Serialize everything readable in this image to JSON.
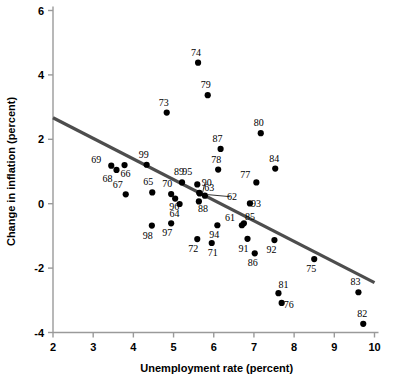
{
  "chart_data": {
    "type": "scatter",
    "title": "",
    "xlabel": "Unemployment rate (percent)",
    "ylabel": "Change in inflation (percent)",
    "xlim": [
      2,
      10
    ],
    "ylim": [
      -4,
      6
    ],
    "xticks": [
      2,
      3,
      4,
      5,
      6,
      7,
      8,
      9,
      10
    ],
    "yticks": [
      -4,
      -2,
      0,
      2,
      4,
      6
    ],
    "xtick_labels": [
      "2",
      "3",
      "4",
      "5",
      "6",
      "7",
      "8",
      "9",
      "10"
    ],
    "ytick_labels": [
      "-4",
      "-2",
      "0",
      "2",
      "4",
      "6"
    ],
    "grid": false,
    "legend": "none",
    "point_color": "#000000",
    "trendline_color": "#4d4d4d",
    "axis_color": "#9a9a9a",
    "trendline": {
      "x0": 2.0,
      "y0": 2.67,
      "x1": 10.0,
      "y1": -2.45
    },
    "point_label_position": "above-left-of-marker",
    "points": [
      {
        "label": "61",
        "x": 6.7,
        "y": -0.67,
        "lx": -12,
        "ly": -4
      },
      {
        "label": "62",
        "x": 5.78,
        "y": 0.25,
        "lx": 27,
        "ly": 4,
        "leader": true
      },
      {
        "label": "63",
        "x": 5.64,
        "y": 0.34,
        "lx": 10,
        "ly": -2
      },
      {
        "label": "64",
        "x": 5.15,
        "y": -0.01,
        "lx": -5,
        "ly": 13
      },
      {
        "label": "65",
        "x": 4.47,
        "y": 0.35,
        "lx": -4,
        "ly": -7
      },
      {
        "label": "66",
        "x": 3.78,
        "y": 1.2,
        "lx": 1,
        "ly": 12
      },
      {
        "label": "67",
        "x": 3.81,
        "y": 0.29,
        "lx": -8,
        "ly": -6
      },
      {
        "label": "68",
        "x": 3.58,
        "y": 1.05,
        "lx": -9,
        "ly": 12
      },
      {
        "label": "69",
        "x": 3.45,
        "y": 1.18,
        "lx": -15,
        "ly": -3
      },
      {
        "label": "70",
        "x": 4.94,
        "y": 0.3,
        "lx": -4,
        "ly": -7
      },
      {
        "label": "71",
        "x": 5.95,
        "y": -1.22,
        "lx": 1,
        "ly": 13
      },
      {
        "label": "72",
        "x": 5.59,
        "y": -1.1,
        "lx": -4,
        "ly": 13
      },
      {
        "label": "73",
        "x": 4.83,
        "y": 2.83,
        "lx": -3,
        "ly": -7
      },
      {
        "label": "74",
        "x": 5.61,
        "y": 4.38,
        "lx": -2,
        "ly": -7
      },
      {
        "label": "75",
        "x": 8.5,
        "y": -1.72,
        "lx": -3,
        "ly": 13
      },
      {
        "label": "76",
        "x": 7.69,
        "y": -3.08,
        "lx": 7,
        "ly": 5
      },
      {
        "label": "77",
        "x": 7.06,
        "y": 0.66,
        "lx": -11,
        "ly": -4
      },
      {
        "label": "78",
        "x": 6.11,
        "y": 1.06,
        "lx": -2,
        "ly": -7
      },
      {
        "label": "79",
        "x": 5.85,
        "y": 3.37,
        "lx": -2,
        "ly": -7
      },
      {
        "label": "80",
        "x": 7.17,
        "y": 2.19,
        "lx": -2,
        "ly": -7
      },
      {
        "label": "81",
        "x": 7.61,
        "y": -2.78,
        "lx": 5,
        "ly": -5
      },
      {
        "label": "82",
        "x": 9.72,
        "y": -3.73,
        "lx": -1,
        "ly": -7
      },
      {
        "label": "83",
        "x": 9.6,
        "y": -2.75,
        "lx": -3,
        "ly": -7
      },
      {
        "label": "84",
        "x": 7.53,
        "y": 1.09,
        "lx": -1,
        "ly": -7
      },
      {
        "label": "85",
        "x": 6.75,
        "y": -0.61,
        "lx": 6,
        "ly": -3
      },
      {
        "label": "86",
        "x": 7.02,
        "y": -1.54,
        "lx": -2,
        "ly": 13
      },
      {
        "label": "87",
        "x": 6.17,
        "y": 1.7,
        "lx": -3,
        "ly": -7
      },
      {
        "label": "88",
        "x": 5.63,
        "y": 0.07,
        "lx": 4,
        "ly": 11
      },
      {
        "label": "89",
        "x": 5.21,
        "y": 0.66,
        "lx": -3,
        "ly": -7
      },
      {
        "label": "90",
        "x": 5.65,
        "y": 0.32,
        "lx": 7,
        "ly": -7,
        "leader": true
      },
      {
        "label": "91",
        "x": 6.84,
        "y": -1.09,
        "lx": -4,
        "ly": 13
      },
      {
        "label": "92",
        "x": 7.51,
        "y": -1.13,
        "lx": -3,
        "ly": 13
      },
      {
        "label": "93",
        "x": 6.9,
        "y": 0.01,
        "lx": 6,
        "ly": 4
      },
      {
        "label": "94",
        "x": 6.09,
        "y": -0.67,
        "lx": -3,
        "ly": 13
      },
      {
        "label": "95",
        "x": 5.59,
        "y": 0.6,
        "lx": -10,
        "ly": -9
      },
      {
        "label": "96",
        "x": 5.04,
        "y": 0.16,
        "lx": -1,
        "ly": 11
      },
      {
        "label": "97",
        "x": 4.94,
        "y": -0.61,
        "lx": -4,
        "ly": 13
      },
      {
        "label": "98",
        "x": 4.46,
        "y": -0.68,
        "lx": -4,
        "ly": 13
      },
      {
        "label": "99",
        "x": 4.33,
        "y": 1.21,
        "lx": -3,
        "ly": -7
      }
    ]
  }
}
